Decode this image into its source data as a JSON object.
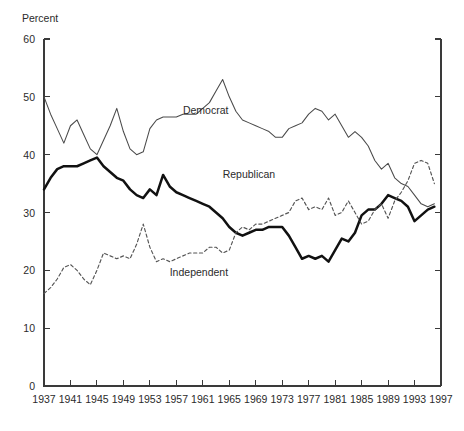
{
  "chart_data": {
    "type": "line",
    "title": "",
    "xlabel": "",
    "ylabel": "Percent",
    "ylim": [
      0,
      60
    ],
    "xlim": [
      1937,
      1997
    ],
    "yticks": [
      0,
      10,
      20,
      30,
      40,
      50,
      60
    ],
    "xticks": [
      1937,
      1941,
      1945,
      1949,
      1953,
      1957,
      1961,
      1965,
      1969,
      1973,
      1977,
      1981,
      1985,
      1989,
      1993,
      1997
    ],
    "grid": false,
    "legend_position": "inline-annotations",
    "x": [
      1937,
      1938,
      1939,
      1940,
      1941,
      1942,
      1943,
      1944,
      1945,
      1946,
      1947,
      1948,
      1949,
      1950,
      1951,
      1952,
      1953,
      1954,
      1955,
      1956,
      1957,
      1958,
      1959,
      1960,
      1961,
      1962,
      1963,
      1964,
      1965,
      1966,
      1967,
      1968,
      1969,
      1970,
      1971,
      1972,
      1973,
      1974,
      1975,
      1976,
      1977,
      1978,
      1979,
      1980,
      1981,
      1982,
      1983,
      1984,
      1985,
      1986,
      1987,
      1988,
      1989,
      1990,
      1991,
      1992,
      1993,
      1994,
      1995,
      1996
    ],
    "series": [
      {
        "name": "Democrat",
        "style": "thin-solid",
        "color": "#4a4a4a",
        "values": [
          50.0,
          47.0,
          44.5,
          42.0,
          45.0,
          46.0,
          43.5,
          41.0,
          40.0,
          42.5,
          45.0,
          48.0,
          44.0,
          41.0,
          40.0,
          40.5,
          44.5,
          46.0,
          46.5,
          46.5,
          46.5,
          47.0,
          47.0,
          47.0,
          48.0,
          49.0,
          51.0,
          53.0,
          50.0,
          47.5,
          46.0,
          45.5,
          45.0,
          44.5,
          44.0,
          43.0,
          43.0,
          44.5,
          45.0,
          45.5,
          47.0,
          48.0,
          47.5,
          46.0,
          47.0,
          45.0,
          43.0,
          44.0,
          43.0,
          41.5,
          39.0,
          37.5,
          38.5,
          36.0,
          35.0,
          34.5,
          33.0,
          31.5,
          31.0,
          31.5
        ]
      },
      {
        "name": "Republican",
        "style": "thick-solid",
        "color": "#111111",
        "values": [
          34.0,
          36.0,
          37.5,
          38.0,
          38.0,
          38.0,
          38.5,
          39.0,
          39.5,
          38.0,
          37.0,
          36.0,
          35.5,
          34.0,
          33.0,
          32.5,
          34.0,
          33.0,
          36.5,
          34.5,
          33.5,
          33.0,
          32.5,
          32.0,
          31.5,
          31.0,
          30.0,
          29.0,
          27.5,
          26.5,
          26.0,
          26.5,
          27.0,
          27.0,
          27.5,
          27.5,
          27.5,
          26.0,
          24.0,
          22.0,
          22.5,
          22.0,
          22.5,
          21.5,
          23.5,
          25.5,
          25.0,
          26.5,
          29.5,
          30.5,
          30.5,
          31.5,
          33.0,
          32.5,
          32.0,
          31.0,
          28.5,
          29.5,
          30.5,
          31.0
        ]
      },
      {
        "name": "Independent",
        "style": "dotted",
        "color": "#555555",
        "values": [
          16.0,
          17.0,
          18.5,
          20.5,
          21.0,
          20.0,
          18.5,
          17.5,
          20.0,
          23.0,
          22.5,
          22.0,
          22.5,
          22.0,
          24.5,
          28.0,
          24.0,
          21.5,
          22.0,
          21.5,
          22.0,
          22.5,
          23.0,
          23.0,
          23.0,
          24.0,
          24.0,
          23.0,
          23.5,
          26.5,
          27.5,
          27.0,
          28.0,
          28.0,
          28.5,
          29.0,
          29.5,
          30.0,
          32.0,
          32.5,
          30.5,
          31.0,
          30.5,
          32.5,
          29.5,
          30.0,
          32.0,
          30.0,
          28.0,
          28.5,
          30.5,
          31.5,
          29.0,
          32.0,
          33.5,
          35.5,
          38.5,
          39.0,
          38.5,
          35.0
        ]
      }
    ],
    "annotations": [
      {
        "text": "Democrat",
        "x": 1958,
        "y": 47.0
      },
      {
        "text": "Republican",
        "x": 1964,
        "y": 36.0
      },
      {
        "text": "Independent",
        "x": 1956,
        "y": 19.0
      }
    ]
  },
  "axis": {
    "y_title": "Percent"
  }
}
